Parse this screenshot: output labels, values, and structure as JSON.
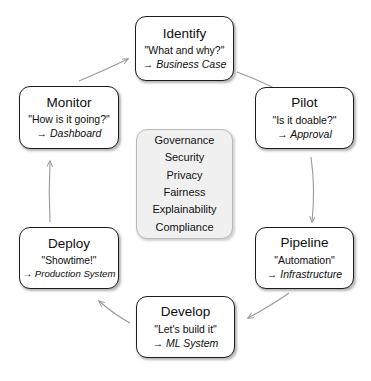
{
  "diagram": {
    "background": "#ffffff",
    "node_border_color": "#1d1d1d",
    "center_fill_color": "#f0f0f0",
    "arrow_color": "#9a9a9a"
  },
  "nodes": [
    {
      "id": "identify",
      "title": "Identify",
      "quote": "\"What and why?\"",
      "arrow_glyph": "→",
      "artifact": "Business Case"
    },
    {
      "id": "pilot",
      "title": "Pilot",
      "quote": "\"Is it doable?\"",
      "arrow_glyph": "→",
      "artifact": "Approval"
    },
    {
      "id": "pipeline",
      "title": "Pipeline",
      "quote": "\"Automation\"",
      "arrow_glyph": "→",
      "artifact": "Infrastructure"
    },
    {
      "id": "develop",
      "title": "Develop",
      "quote": "\"Let's build it\"",
      "arrow_glyph": "→",
      "artifact": "ML System"
    },
    {
      "id": "deploy",
      "title": "Deploy",
      "quote": "\"Showtime!\"",
      "arrow_glyph": "→",
      "artifact": "Production System"
    },
    {
      "id": "monitor",
      "title": "Monitor",
      "quote": "\"How is it going?\"",
      "arrow_glyph": "→",
      "artifact": "Dashboard"
    }
  ],
  "center": {
    "items": [
      "Governance",
      "Security",
      "Privacy",
      "Fairness",
      "Explainability",
      "Compliance"
    ]
  },
  "edges": [
    {
      "from": "identify",
      "to": "pilot"
    },
    {
      "from": "pilot",
      "to": "pipeline"
    },
    {
      "from": "pipeline",
      "to": "develop"
    },
    {
      "from": "develop",
      "to": "deploy"
    },
    {
      "from": "deploy",
      "to": "monitor"
    },
    {
      "from": "monitor",
      "to": "identify"
    }
  ]
}
